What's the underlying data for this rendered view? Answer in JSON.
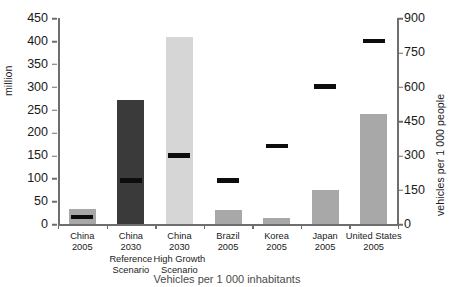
{
  "chart_data": {
    "type": "bar",
    "title": "",
    "subtitle": "",
    "xlabel": "",
    "ylabel": "million",
    "ylabel_secondary": "vehicles per 1 000 people",
    "ylim": [
      0,
      450
    ],
    "ylim_secondary": [
      0,
      900
    ],
    "yticks": [
      0,
      50,
      100,
      150,
      200,
      250,
      300,
      350,
      400,
      450
    ],
    "yticks_secondary": [
      0,
      150,
      300,
      450,
      600,
      750,
      900
    ],
    "grid": false,
    "legend": false,
    "categories": [
      "China\n2005",
      "China\n2030\nReference\nScenario",
      "China\n2030\nHigh Growth\nScenario",
      "Brazil\n2005",
      "Korea\n2005",
      "Japan\n2005",
      "United States\n2005"
    ],
    "series": [
      {
        "name": "Vehicle stock",
        "axis": "left",
        "unit": "million",
        "type": "bar",
        "values": [
          33,
          270,
          408,
          30,
          14,
          75,
          240
        ],
        "colors": [
          "#a8a8a8",
          "#3a3a3a",
          "#d6d6d6",
          "#a8a8a8",
          "#a8a8a8",
          "#a8a8a8",
          "#a8a8a8"
        ]
      },
      {
        "name": "Vehicles per 1 000 people",
        "axis": "right",
        "unit": "vehicles per 1 000 people",
        "type": "marker",
        "values": [
          30,
          190,
          300,
          190,
          340,
          600,
          800
        ],
        "color": "#0d0d0d"
      }
    ]
  },
  "axes": {
    "left_title": "million",
    "right_title": "vehicles per 1 000 people",
    "left_ticks": [
      "450",
      "400",
      "350",
      "300",
      "250",
      "200",
      "150",
      "100",
      "50",
      "0"
    ],
    "right_ticks": [
      "900",
      "750",
      "600",
      "450",
      "300",
      "150",
      "0"
    ]
  },
  "categories": [
    {
      "lines": [
        "China",
        "2005"
      ]
    },
    {
      "lines": [
        "China",
        "2030",
        "Reference",
        "Scenario"
      ]
    },
    {
      "lines": [
        "China",
        "2030",
        "High Growth",
        "Scenario"
      ]
    },
    {
      "lines": [
        "Brazil",
        "2005"
      ]
    },
    {
      "lines": [
        "Korea",
        "2005"
      ]
    },
    {
      "lines": [
        "Japan",
        "2005"
      ]
    },
    {
      "lines": [
        "United States",
        "2005"
      ]
    }
  ],
  "caption": "Vehicles per 1 000 inhabitants",
  "colors": {
    "bar_default": "#a8a8a8",
    "bar_dark": "#3a3a3a",
    "bar_light": "#d6d6d6",
    "marker": "#0d0d0d",
    "axis": "#6e6e6e"
  }
}
